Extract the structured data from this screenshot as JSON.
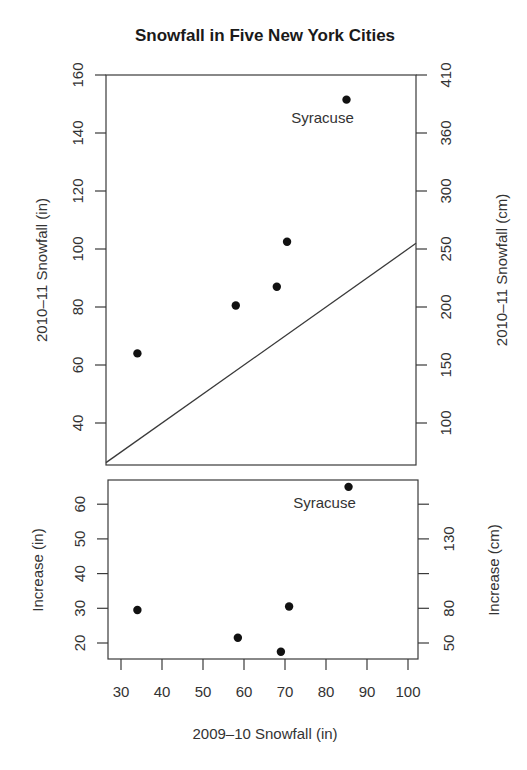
{
  "chart_data": [
    {
      "type": "scatter",
      "title": "Snowfall in Five New York Cities",
      "xlabel": "2009–10 Snowfall (in)",
      "ylabel": "2010–11 Snowfall (in)",
      "ylabel_right": "2010–11 Snowfall (cm)",
      "xlim": [
        27,
        102
      ],
      "ylim": [
        25,
        160
      ],
      "x_ticks": [
        30,
        40,
        50,
        60,
        70,
        80,
        90,
        100
      ],
      "y_ticks": [
        40,
        60,
        80,
        100,
        120,
        140,
        160
      ],
      "y_right_tick_labels": [
        "100",
        "150",
        "200",
        "250",
        "300",
        "360",
        "410"
      ],
      "reference_line": "y = x",
      "grid": false,
      "series": [
        {
          "name": "Cities",
          "x": [
            34,
            58,
            68,
            70.5,
            85
          ],
          "y": [
            64,
            80.5,
            87,
            102.5,
            151.5
          ]
        }
      ],
      "annotations": [
        {
          "text": "Syracuse",
          "x": 85,
          "y": 151.5
        }
      ]
    },
    {
      "type": "scatter",
      "xlabel": "2009–10 Snowfall (in)",
      "ylabel": "Increase (in)",
      "ylabel_right": "Increase (cm)",
      "xlim": [
        27,
        102
      ],
      "ylim": [
        15.5,
        67
      ],
      "x_ticks": [
        30,
        40,
        50,
        60,
        70,
        80,
        90,
        100
      ],
      "y_ticks": [
        20,
        30,
        40,
        50,
        60
      ],
      "y_right_tick_labels": [
        "50",
        "80",
        "",
        "130",
        ""
      ],
      "grid": false,
      "series": [
        {
          "name": "Increase",
          "x": [
            34,
            58.5,
            69,
            71,
            85.5
          ],
          "y": [
            29.5,
            21.5,
            17.5,
            30.5,
            65
          ]
        }
      ],
      "annotations": [
        {
          "text": "Syracuse",
          "x": 85.5,
          "y": 65
        }
      ]
    }
  ],
  "labels": {
    "title": "Snowfall in Five New York Cities",
    "top_ylabel_left": "2010–11 Snowfall (in)",
    "top_ylabel_right": "2010–11 Snowfall (cm)",
    "bottom_ylabel_left": "Increase (in)",
    "bottom_ylabel_right": "Increase (cm)",
    "xlabel": "2009–10 Snowfall (in)",
    "annotation_top": "Syracuse",
    "annotation_bottom": "Syracuse"
  }
}
